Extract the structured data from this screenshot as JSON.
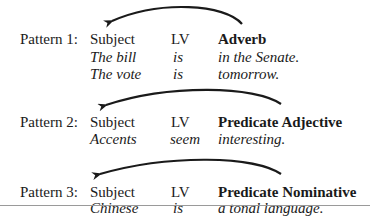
{
  "patterns": [
    {
      "label": "Pattern 1:",
      "headers": {
        "subject": "Subject",
        "lv": "LV",
        "complement": "Adverb"
      },
      "examples": [
        {
          "subject": "The bill",
          "lv": "is",
          "complement": "in the Senate."
        },
        {
          "subject": "The vote",
          "lv": "is",
          "complement": "tomorrow."
        }
      ],
      "arrow": "curved-arrow-left"
    },
    {
      "label": "Pattern 2:",
      "headers": {
        "subject": "Subject",
        "lv": "LV",
        "complement": "Predicate Adjective"
      },
      "examples": [
        {
          "subject": "Accents",
          "lv": "seem",
          "complement": "interesting."
        }
      ],
      "arrow": "curved-arrow-left"
    },
    {
      "label": "Pattern 3:",
      "headers": {
        "subject": "Subject",
        "lv": "LV",
        "complement": "Predicate Nominative"
      },
      "examples": [
        {
          "subject": "Chinese",
          "lv": "is",
          "complement": "a tonal language."
        }
      ],
      "arrow": "curved-arrow-left"
    }
  ]
}
